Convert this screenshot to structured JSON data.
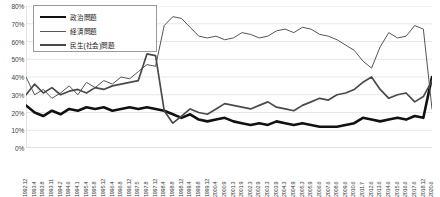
{
  "chart_data": {
    "type": "line",
    "title": "",
    "xlabel": "",
    "ylabel": "",
    "ylim": [
      0,
      80
    ],
    "ytick_labels": [
      "0%",
      "10%",
      "20%",
      "30%",
      "40%",
      "50%",
      "60%",
      "70%",
      "80%"
    ],
    "ytick_values": [
      0,
      10,
      20,
      30,
      40,
      50,
      60,
      70,
      80
    ],
    "grid": true,
    "legend_position": "top-left",
    "x": [
      "1992.12",
      "1993.4",
      "1993.8",
      "1993.11",
      "1994.2",
      "1994.6",
      "1994.1",
      "1995.4",
      "1995.8",
      "1995.12",
      "1996.4",
      "1996.8",
      "1996.12",
      "1997.5",
      "1997.8",
      "1997.12",
      "1998.4",
      "1998.8",
      "1998.12",
      "1999.4",
      "1999.8",
      "1999.12",
      "2000.4",
      "2000.9",
      "2001.3",
      "2001.9",
      "2002.3",
      "2002.9",
      "2003.3",
      "2003.9",
      "2004.3",
      "2004.9",
      "2005.3",
      "2005.9",
      "2006.6",
      "2007.6",
      "2008.6",
      "2009.6",
      "2010.6",
      "2011.7",
      "2012.6",
      "2013.6",
      "2014.6",
      "2015.6",
      "2016.6",
      "2017.6",
      "2018.12",
      "2020.6"
    ],
    "series": [
      {
        "name": "政治問題",
        "style": "thick-black",
        "color": "#111111",
        "values": [
          24,
          20,
          18,
          21,
          19,
          22,
          21,
          23,
          22,
          23,
          21,
          22,
          23,
          22,
          23,
          22,
          21,
          19,
          17,
          19,
          16,
          15,
          16,
          17,
          15,
          14,
          13,
          14,
          13,
          15,
          14,
          13,
          14,
          13,
          12,
          12,
          12,
          13,
          14,
          17,
          16,
          15,
          16,
          17,
          16,
          18,
          17,
          40
        ]
      },
      {
        "name": "経済問題",
        "style": "thin-gray",
        "color": "#555555",
        "values": [
          40,
          30,
          33,
          28,
          31,
          35,
          30,
          37,
          34,
          38,
          36,
          40,
          39,
          43,
          47,
          46,
          69,
          74,
          73,
          68,
          63,
          62,
          63,
          61,
          62,
          65,
          64,
          62,
          63,
          66,
          67,
          65,
          68,
          67,
          64,
          63,
          61,
          58,
          55,
          49,
          45,
          57,
          65,
          62,
          63,
          69,
          67,
          22
        ]
      },
      {
        "name": "民生(社会)問題",
        "style": "medium-gray",
        "color": "#4a4a4a",
        "values": [
          30,
          36,
          31,
          34,
          30,
          32,
          33,
          31,
          34,
          33,
          35,
          36,
          37,
          38,
          53,
          52,
          21,
          14,
          18,
          22,
          20,
          19,
          22,
          25,
          24,
          23,
          22,
          24,
          26,
          23,
          22,
          21,
          24,
          26,
          28,
          27,
          30,
          31,
          33,
          37,
          40,
          33,
          28,
          30,
          31,
          26,
          29,
          38
        ]
      }
    ]
  },
  "legend": {
    "items": [
      {
        "label": "政治問題"
      },
      {
        "label": "経済問題"
      },
      {
        "label": "民生(社会)問題"
      }
    ]
  }
}
